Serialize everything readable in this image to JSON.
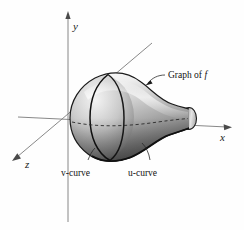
{
  "figure": {
    "background_color": "#fefefe",
    "axes": {
      "y_label": "y",
      "x_label": "x",
      "z_label": "z",
      "axis_color": "#7a7a7a",
      "origin": [
        68,
        117
      ]
    },
    "annotations": {
      "graph_label_prefix": "Graph of ",
      "graph_label_symbol": "f",
      "v_curve_label": "v-curve",
      "u_curve_label": "u-curve"
    },
    "surface": {
      "name": "vase-surface",
      "description": "shaded bulbous vase-like surface of revolution opening to a narrow neck at right",
      "fill_light": "#f2f2f2",
      "fill_mid": "#b9b9b9",
      "fill_dark": "#6d6d6d",
      "outline_color": "#1b1b1b",
      "curve_color": "#101010",
      "hidden_curve_style": "dashed"
    }
  }
}
